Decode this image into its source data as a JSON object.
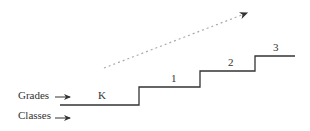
{
  "diagram": {
    "row_labels": {
      "grades": "Grades",
      "classes": "Classes"
    },
    "steps": [
      {
        "label": "K"
      },
      {
        "label": "1"
      },
      {
        "label": "2"
      },
      {
        "label": "3"
      }
    ],
    "colors": {
      "line": "#333333",
      "dashed_arrow": "#aaaaaa"
    }
  }
}
